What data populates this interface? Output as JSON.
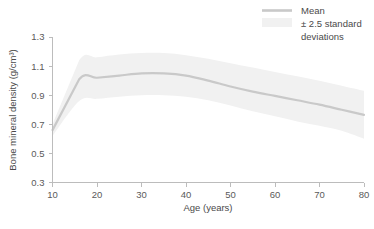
{
  "chart_data": {
    "type": "line",
    "title": "",
    "subtitle": "",
    "xlabel": "Age (years)",
    "ylabel": "Bone mineral density (g/cm³)",
    "xlim": [
      10,
      80
    ],
    "ylim": [
      0.3,
      1.3
    ],
    "xticks": [
      10,
      20,
      30,
      40,
      50,
      60,
      70,
      80
    ],
    "xtick_labels": [
      "10",
      "20",
      "30",
      "40",
      "50",
      "60",
      "70",
      "80"
    ],
    "yticks": [
      0.3,
      0.5,
      0.7,
      0.9,
      1.1,
      1.3
    ],
    "ytick_labels": [
      "0.3",
      "0.5",
      "0.7",
      "0.9",
      "1.1",
      "1.3"
    ],
    "grid": false,
    "legend_position": "top-right",
    "legend": [
      {
        "label": "Mean",
        "marker": "line",
        "color": "#c9c9c9"
      },
      {
        "label": "± 2.5 standard deviations",
        "marker": "band",
        "color": "#f1f1f1"
      }
    ],
    "x": [
      10,
      16,
      20,
      25,
      30,
      35,
      40,
      45,
      50,
      55,
      60,
      65,
      70,
      75,
      80
    ],
    "series": [
      {
        "name": "Mean",
        "color": "#c9c9c9",
        "values": [
          0.66,
          1.01,
          1.02,
          1.035,
          1.05,
          1.05,
          1.035,
          1.0,
          0.96,
          0.925,
          0.895,
          0.865,
          0.835,
          0.8,
          0.765
        ]
      },
      {
        "name": "+2.5 standard deviations",
        "color": "#f1f1f1",
        "values": [
          0.7,
          1.14,
          1.16,
          1.18,
          1.19,
          1.19,
          1.175,
          1.15,
          1.12,
          1.09,
          1.06,
          1.03,
          1.0,
          0.965,
          0.93
        ]
      },
      {
        "name": "-2.5 standard deviations",
        "color": "#f1f1f1",
        "values": [
          0.62,
          0.86,
          0.875,
          0.89,
          0.9,
          0.9,
          0.89,
          0.865,
          0.83,
          0.79,
          0.755,
          0.72,
          0.69,
          0.655,
          0.6
        ]
      }
    ]
  },
  "axes": {
    "y_axis_title": "Bone mineral density (g/cm³)",
    "x_axis_title": "Age (years)"
  },
  "legend": {
    "mean_label": "Mean",
    "band_label_line1": "± 2.5 standard",
    "band_label_line2": "deviations"
  },
  "caption": {
    "text": ""
  }
}
